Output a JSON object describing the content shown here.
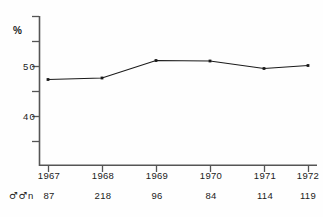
{
  "chart_data": {
    "type": "line",
    "title": "",
    "subtitle": "",
    "xlabel": "",
    "ylabel": "%",
    "ylabel_unit": "%",
    "categories": [
      "1967",
      "1968",
      "1969",
      "1970",
      "1971",
      "1972"
    ],
    "values": [
      47.4,
      47.7,
      51.2,
      51.1,
      49.6,
      50.2
    ],
    "series": [
      {
        "name": "",
        "values": [
          47.4,
          47.7,
          51.2,
          51.1,
          49.6,
          50.2
        ]
      }
    ],
    "ylim": [
      35,
      55
    ],
    "ytick_labels": [
      "50",
      "40"
    ],
    "ytick_values": [
      50,
      40
    ],
    "yminor_ticks": [
      55,
      45,
      35
    ],
    "grid": false,
    "legend": "none",
    "marker": "square-dot",
    "line_color": "#1a1a1a",
    "marker_color": "#1a1a1a",
    "axis_color": "#555555"
  },
  "annotations": {
    "n_row": {
      "label_symbols": "♂♂",
      "label_text": "n",
      "values": [
        "87",
        "218",
        "96",
        "84",
        "114",
        "119"
      ]
    }
  },
  "axes": {
    "y_unit": "%",
    "y_labels": [
      {
        "text": "50",
        "value": 50
      },
      {
        "text": "40",
        "value": 40
      }
    ],
    "x_labels": [
      "1967",
      "1968",
      "1969",
      "1970",
      "1971",
      "1972"
    ]
  }
}
